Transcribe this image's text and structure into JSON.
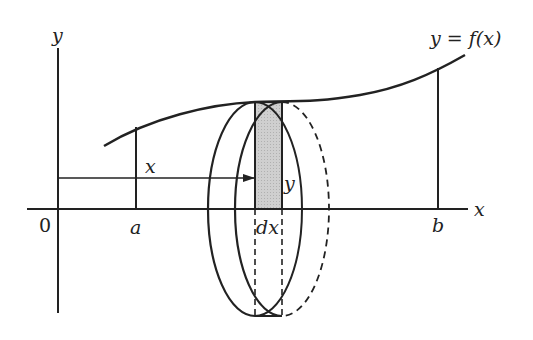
{
  "diagram": {
    "labels": {
      "y_axis": "y",
      "x_axis": "x",
      "origin": "0",
      "a": "a",
      "b": "b",
      "dx": "dx",
      "radius": "y",
      "distance": "x",
      "function": "y = f(x)"
    },
    "colors": {
      "stroke": "#222222",
      "strip_fill": "#c4c4c4"
    }
  }
}
